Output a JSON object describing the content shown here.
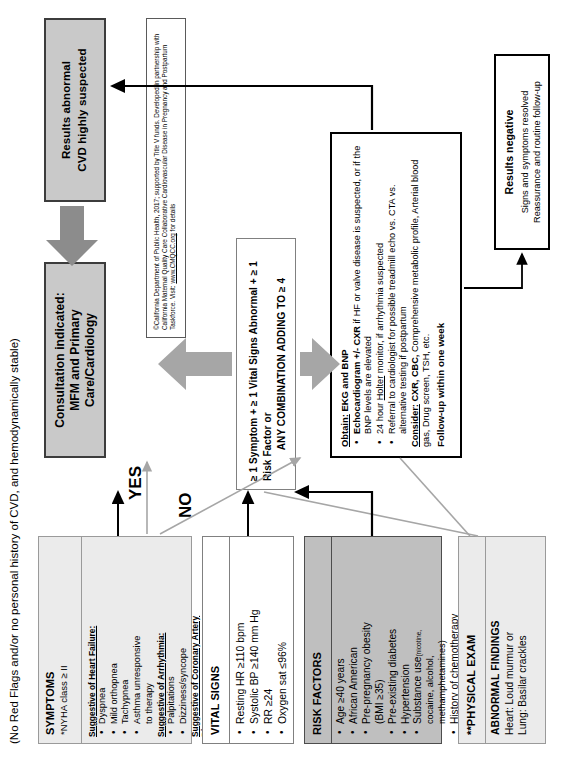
{
  "headline": "(No Red Flags and/or no personal history of CVD, and hemodynamically stable)",
  "symptoms": {
    "title": "SYMPTOMS",
    "subtitle": "*NYHA class  ≥ II",
    "groups": [
      {
        "heading": "Suggestive of Heart Failure:",
        "items": [
          "Dyspnea",
          "Mild orthopnea",
          "Tachypnea",
          "Asthma unresponsive",
          "to therapy"
        ]
      },
      {
        "heading": "Suggestive of Arrhythmia:",
        "items": [
          "Palpitations",
          "Dizziness/syncope"
        ]
      },
      {
        "heading": "Suggestive of Coronary Artery",
        "heading2": "Disease:",
        "items": [
          "Chest pain",
          "Dyspnea"
        ]
      }
    ]
  },
  "vitals": {
    "title": "VITAL SIGNS",
    "items": [
      "Resting HR ≥110 bpm",
      "Systolic BP ≥140 mm Hg",
      "RR ≥24",
      "Oxygen sat ≤96%"
    ]
  },
  "risk": {
    "title": "RISK FACTORS",
    "items": [
      "Age ≥40 years",
      "African American",
      "Pre-pregnancy obesity",
      "(BMI ≥35)",
      "Pre-existing diabetes",
      "Hypertension",
      "Substance use",
      "History of chemotherapy"
    ],
    "substance_note": "(nicotine,",
    "substance_note2": "cocaine, alcohol,",
    "substance_note3": "methamphetamines)"
  },
  "exam": {
    "title": "**PHYSICAL EXAM",
    "subtitle": "ABNORMAL FINDINGS",
    "lines": [
      "Heart: Loud murmur or",
      "Lung: Basilar crackles"
    ],
    "underline_word": "or"
  },
  "decision": {
    "line1": "≥ 1 Symptom + ≥ 1 Vital Signs Abnormal + ≥ 1 Risk Factor or",
    "line2": "ANY COMBINATION ADDING TO ≥ 4"
  },
  "consult": {
    "line1": "Consultation indicated:",
    "line2": "MFM and Primary",
    "line3": "Care/Cardiology",
    "italic_word": "and"
  },
  "abnormal": {
    "line1": "Results abnormal",
    "line2": "CVD highly suspected"
  },
  "workup": {
    "heading": "Obtain: EKG and BNP",
    "heading_underline": "Obtain:",
    "bullets": [
      "Echocardiogram +/- CXR if HF or valve disease is suspected, or if the BNP levels are elevated",
      "24 hour Holter monitor, if arrhythmia suspected",
      "Referral to cardiologist for possible treadmill echo vs. CTA vs. alternative testing if postpartum"
    ],
    "bold_parts": [
      "Echocardiogram +/- CXR",
      "Holter",
      "Consider: CXR, CBC,"
    ],
    "consider": "Consider: CXR, CBC, Comprehensive metabolic profile, Arterial blood gas, Drug screen, TSH, etc.",
    "followup": "Follow-up within one week"
  },
  "negative": {
    "line1": "Results negative",
    "line2": "Signs and symptoms resolved",
    "line3": "Reassurance and routine follow-up"
  },
  "labels": {
    "yes": "YES",
    "no": "NO"
  },
  "citation": {
    "line1": "©California Department of Public Health, 2017; supported by Title V funds. Developed in partnership with",
    "line2": "California Maternal Quality Care Collaborative Cardiovascular Disease in Pregnancy and Postpartum",
    "line3_pre": "Taskforce. Visit: ",
    "line3_link": "www.CMQCC.org",
    "line3_post": " for details"
  },
  "colors": {
    "light_box": "#ebebeb",
    "grey_box": "#bfbfbf",
    "dark_box": "#c9c9c9",
    "border_dark": "#3c3c3c",
    "arrow_grey": "#a6a6a6"
  }
}
